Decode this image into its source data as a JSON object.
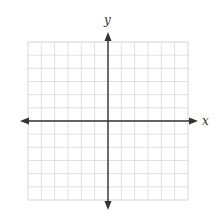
{
  "diagram": {
    "type": "coordinate-plane",
    "x_axis_label": "x",
    "y_axis_label": "y",
    "grid": {
      "columns": 12,
      "rows": 12,
      "left": 28,
      "top": 42,
      "right": 188,
      "bottom": 200,
      "line_color": "#d9d9d9",
      "border_color": "#cccccc"
    },
    "axes": {
      "origin_x": 108,
      "origin_y": 121,
      "x_start": 20,
      "x_end": 198,
      "y_start": 32,
      "y_end": 210,
      "color": "#333333"
    }
  }
}
